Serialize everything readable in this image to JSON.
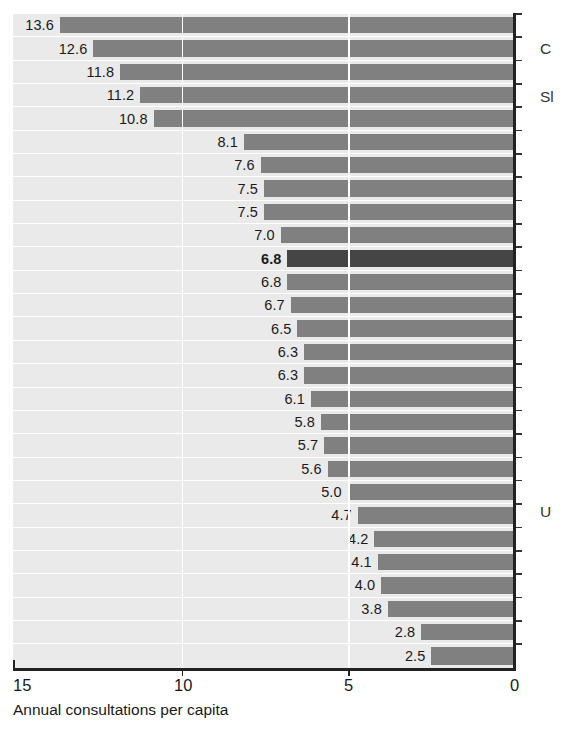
{
  "chart_data": {
    "type": "bar",
    "orientation": "horizontal",
    "title": "",
    "subtitle": "",
    "xlabel": "Annual consultations per capita",
    "ylabel": "",
    "xlim": [
      15,
      0
    ],
    "x_axis_reversed": true,
    "xticks": [
      "15",
      "10",
      "5",
      "0"
    ],
    "xtick_values": [
      15,
      10,
      5,
      0
    ],
    "grid": "vertical gridlines at 10 and 5, white on light-grey row bands",
    "legend": "none",
    "bar_color": "#808080",
    "highlight_color": "#454545",
    "row_band_color": "#eaeaea",
    "categories": [
      "",
      "",
      "",
      "",
      "",
      "",
      "",
      "",
      "",
      "",
      "",
      "",
      "",
      "",
      "",
      "",
      "",
      "",
      "",
      "",
      "",
      "",
      "",
      "",
      "",
      "",
      "",
      ""
    ],
    "values": [
      13.6,
      12.6,
      11.8,
      11.2,
      10.8,
      8.1,
      7.6,
      7.5,
      7.5,
      7.0,
      6.8,
      6.8,
      6.7,
      6.5,
      6.3,
      6.3,
      6.1,
      5.8,
      5.7,
      5.6,
      5.0,
      4.7,
      4.2,
      4.1,
      4.0,
      3.8,
      2.8,
      2.5
    ],
    "data_labels": [
      "13.6",
      "12.6",
      "11.8",
      "11.2",
      "10.8",
      "8.1",
      "7.6",
      "7.5",
      "7.5",
      "7.0",
      "6.8",
      "6.8",
      "6.7",
      "6.5",
      "6.3",
      "6.3",
      "6.1",
      "5.8",
      "5.7",
      "5.6",
      "5.0",
      "4.7",
      "4.2",
      "4.1",
      "4.0",
      "3.8",
      "2.8",
      "2.5"
    ],
    "highlighted_index": 10,
    "bar_count": 28,
    "annotations": [
      {
        "text": "C",
        "note": "clipped country label at right edge",
        "row": 1
      },
      {
        "text": "Sl",
        "note": "clipped country label at right edge",
        "row": 3
      },
      {
        "text": "U",
        "note": "clipped country label at right edge",
        "row": 21
      }
    ]
  },
  "axis": {
    "x_title": "Annual consultations per capita",
    "ticks": [
      {
        "label": "15",
        "value": 15
      },
      {
        "label": "10",
        "value": 10
      },
      {
        "label": "5",
        "value": 5
      },
      {
        "label": "0",
        "value": 0
      }
    ]
  },
  "right_labels": [
    {
      "text": "C",
      "top": 40
    },
    {
      "text": "Sl",
      "top": 88
    },
    {
      "text": "U",
      "top": 503
    }
  ]
}
